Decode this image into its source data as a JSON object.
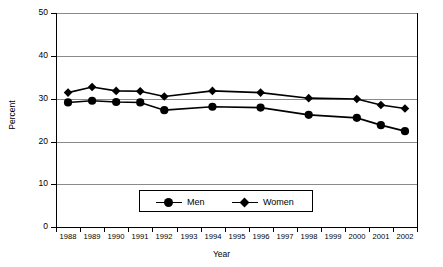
{
  "chart_data": {
    "type": "line",
    "title": "",
    "xlabel": "Year",
    "ylabel": "Percent",
    "categories": [
      "1988",
      "1989",
      "1990",
      "1991",
      "1992",
      "1993",
      "1994",
      "1995",
      "1996",
      "1997",
      "1998",
      "1999",
      "2000",
      "2001",
      "2002"
    ],
    "ylim": [
      0,
      50
    ],
    "yticks": [
      0,
      10,
      20,
      30,
      40,
      50
    ],
    "grid": true,
    "legend_position": "inside-bottom-center",
    "series": [
      {
        "name": "Men",
        "marker": "circle",
        "x": [
          "1988",
          "1989",
          "1990",
          "1991",
          "1992",
          "1994",
          "1996",
          "1998",
          "2000",
          "2001",
          "2002"
        ],
        "values": [
          29.1,
          29.5,
          29.2,
          29.1,
          27.3,
          28.1,
          27.9,
          26.2,
          25.5,
          23.8,
          22.4
        ]
      },
      {
        "name": "Women",
        "marker": "diamond",
        "x": [
          "1988",
          "1989",
          "1990",
          "1991",
          "1992",
          "1994",
          "1996",
          "1998",
          "2000",
          "2001",
          "2002"
        ],
        "values": [
          31.4,
          32.7,
          31.8,
          31.7,
          30.5,
          31.8,
          31.4,
          30.1,
          29.9,
          28.5,
          27.7
        ]
      }
    ]
  },
  "axes": {
    "y_title": "Percent",
    "x_title": "Year",
    "y_tick_labels": [
      "50",
      "40",
      "30",
      "20",
      "10",
      "0"
    ],
    "x_tick_labels": [
      "1988",
      "1989",
      "1990",
      "1991",
      "1992",
      "1993",
      "1994",
      "1995",
      "1996",
      "1997",
      "1998",
      "1999",
      "2000",
      "2001",
      "2002"
    ]
  },
  "legend": {
    "entries": [
      {
        "label": "Men",
        "marker": "circle-marker"
      },
      {
        "label": "Women",
        "marker": "diamond-marker"
      }
    ]
  },
  "colors": {
    "series": "#000000",
    "gridline": "#8a8a8a",
    "axis": "#000000",
    "background": "#ffffff"
  }
}
